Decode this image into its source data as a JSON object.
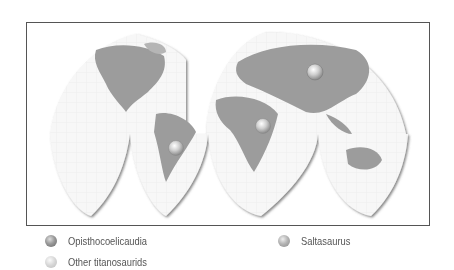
{
  "map": {
    "type": "interrupted world map (goode homolosine-like)",
    "markers": [
      {
        "name": "opisthocoelicaudia-marker",
        "location": "Mongolia",
        "species": "Opisthocoelicaudia"
      },
      {
        "name": "saltasaurus-marker",
        "location": "Argentina",
        "species": "Saltasaurus"
      },
      {
        "name": "other-titanosaurids-marker",
        "location": "East Africa",
        "species": "Other titanosaurids"
      }
    ]
  },
  "legend": {
    "items": [
      {
        "label": "Opisthocoelicaudia",
        "icon": "dark-sphere-icon"
      },
      {
        "label": "Saltasaurus",
        "icon": "medium-sphere-icon"
      },
      {
        "label": "Other titanosaurids",
        "icon": "light-sphere-icon"
      }
    ]
  },
  "colors": {
    "land": "#9a9a9a",
    "ocean": "#f7f7f7",
    "grid": "#dddddd",
    "frame": "#555555",
    "text": "#555555"
  }
}
